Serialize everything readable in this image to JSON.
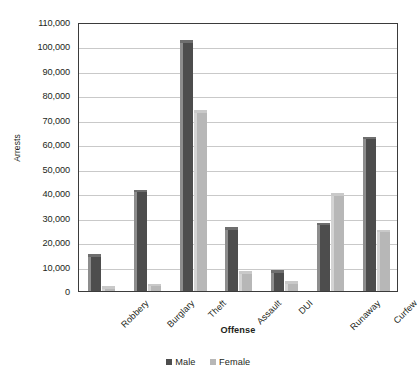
{
  "chart_data": {
    "type": "bar",
    "title": "",
    "xlabel": "Offense",
    "ylabel": "Arrests",
    "categories": [
      "Robbery",
      "Burglary",
      "Theft",
      "Assault",
      "DUI",
      "Runaway",
      "Curfew"
    ],
    "series": [
      {
        "name": "Male",
        "color": "#4d4d4d",
        "values": [
          15000,
          41500,
          102500,
          26000,
          8500,
          28000,
          63000
        ]
      },
      {
        "name": "Female",
        "color": "#b7b7b7",
        "values": [
          2000,
          3000,
          74000,
          8000,
          4000,
          40000,
          25000
        ]
      }
    ],
    "ylim": [
      0,
      110000
    ],
    "ytick_labels": [
      "110,000",
      "100,000",
      "90,000",
      "80,000",
      "70,000",
      "60,000",
      "50,000",
      "40,000",
      "30,000",
      "20,000",
      "10,000",
      "0"
    ],
    "ytick_values": [
      110000,
      100000,
      90000,
      80000,
      70000,
      60000,
      50000,
      40000,
      30000,
      20000,
      10000,
      0
    ],
    "ytick_step": 10000,
    "grid": true,
    "grid_axis": "y",
    "legend_position": "bottom",
    "x_label_rotation": -45
  }
}
